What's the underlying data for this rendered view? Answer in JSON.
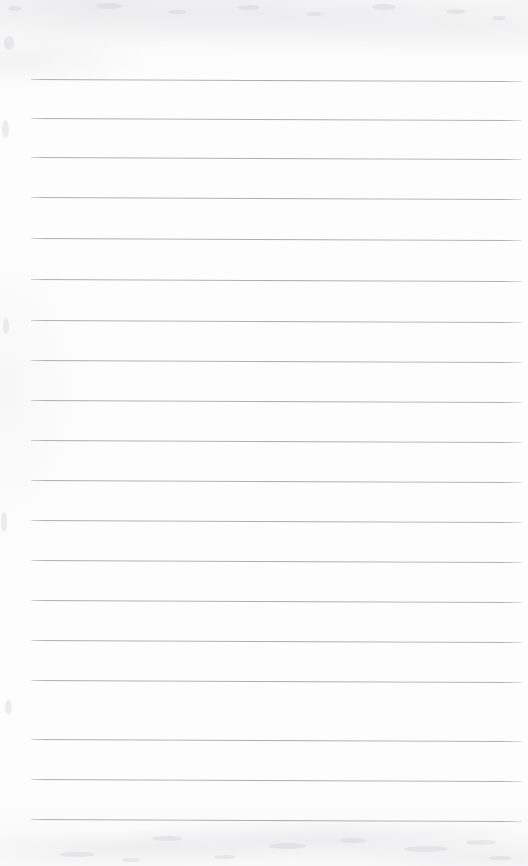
{
  "document": {
    "kind": "scanned-lined-paper",
    "title": "Blank Ruled Notepad Page",
    "content_text": "",
    "handwriting_text": "",
    "page_number": "",
    "width_px": 528,
    "height_px": 866
  },
  "appearance": {
    "paper_color": "#fdfdfd",
    "rule_color": "#a8a8ae",
    "rule_thickness_px": 1,
    "rule_spacing_px": 40,
    "rule_left_px": 31,
    "rule_right_px": 522,
    "first_rule_y_px": 79,
    "last_rule_y_px": 819,
    "skew_deg": 0.23
  },
  "rules": {
    "count": 19,
    "lines": [
      {
        "index": 1,
        "y": 79,
        "x1": 31,
        "x2": 522
      },
      {
        "index": 2,
        "y": 118,
        "x1": 31,
        "x2": 522
      },
      {
        "index": 3,
        "y": 157,
        "x1": 31,
        "x2": 522
      },
      {
        "index": 4,
        "y": 197,
        "x1": 31,
        "x2": 522
      },
      {
        "index": 5,
        "y": 238,
        "x1": 31,
        "x2": 522
      },
      {
        "index": 6,
        "y": 279,
        "x1": 31,
        "x2": 522
      },
      {
        "index": 7,
        "y": 320,
        "x1": 31,
        "x2": 522
      },
      {
        "index": 8,
        "y": 360,
        "x1": 31,
        "x2": 522
      },
      {
        "index": 9,
        "y": 400,
        "x1": 31,
        "x2": 522
      },
      {
        "index": 10,
        "y": 440,
        "x1": 31,
        "x2": 522
      },
      {
        "index": 11,
        "y": 480,
        "x1": 31,
        "x2": 522
      },
      {
        "index": 12,
        "y": 520,
        "x1": 31,
        "x2": 522
      },
      {
        "index": 13,
        "y": 560,
        "x1": 31,
        "x2": 522
      },
      {
        "index": 14,
        "y": 600,
        "x1": 31,
        "x2": 522
      },
      {
        "index": 15,
        "y": 640,
        "x1": 31,
        "x2": 522
      },
      {
        "index": 16,
        "y": 680,
        "x1": 31,
        "x2": 522
      },
      {
        "index": 17,
        "y": 739,
        "x1": 31,
        "x2": 522
      },
      {
        "index": 18,
        "y": 779,
        "x1": 31,
        "x2": 522
      },
      {
        "index": 19,
        "y": 819,
        "x1": 31,
        "x2": 522
      }
    ]
  },
  "specks": [
    {
      "x": 8,
      "y": 6,
      "w": 13,
      "h": 5
    },
    {
      "x": 96,
      "y": 3,
      "w": 26,
      "h": 6
    },
    {
      "x": 168,
      "y": 10,
      "w": 18,
      "h": 4
    },
    {
      "x": 238,
      "y": 5,
      "w": 22,
      "h": 5
    },
    {
      "x": 306,
      "y": 12,
      "w": 16,
      "h": 4
    },
    {
      "x": 372,
      "y": 4,
      "w": 24,
      "h": 6
    },
    {
      "x": 446,
      "y": 9,
      "w": 20,
      "h": 5
    },
    {
      "x": 492,
      "y": 16,
      "w": 14,
      "h": 4
    },
    {
      "x": 4,
      "y": 36,
      "w": 10,
      "h": 14
    },
    {
      "x": 2,
      "y": 120,
      "w": 7,
      "h": 18
    },
    {
      "x": 3,
      "y": 318,
      "w": 6,
      "h": 16
    },
    {
      "x": 1,
      "y": 512,
      "w": 6,
      "h": 20
    },
    {
      "x": 5,
      "y": 700,
      "w": 7,
      "h": 14
    },
    {
      "x": 152,
      "y": 836,
      "w": 30,
      "h": 5
    },
    {
      "x": 268,
      "y": 843,
      "w": 38,
      "h": 6
    },
    {
      "x": 340,
      "y": 838,
      "w": 26,
      "h": 5
    },
    {
      "x": 404,
      "y": 846,
      "w": 44,
      "h": 6
    },
    {
      "x": 466,
      "y": 840,
      "w": 30,
      "h": 5
    },
    {
      "x": 60,
      "y": 852,
      "w": 34,
      "h": 5
    },
    {
      "x": 214,
      "y": 855,
      "w": 22,
      "h": 4
    },
    {
      "x": 122,
      "y": 858,
      "w": 18,
      "h": 4
    },
    {
      "x": 488,
      "y": 856,
      "w": 24,
      "h": 4
    }
  ]
}
